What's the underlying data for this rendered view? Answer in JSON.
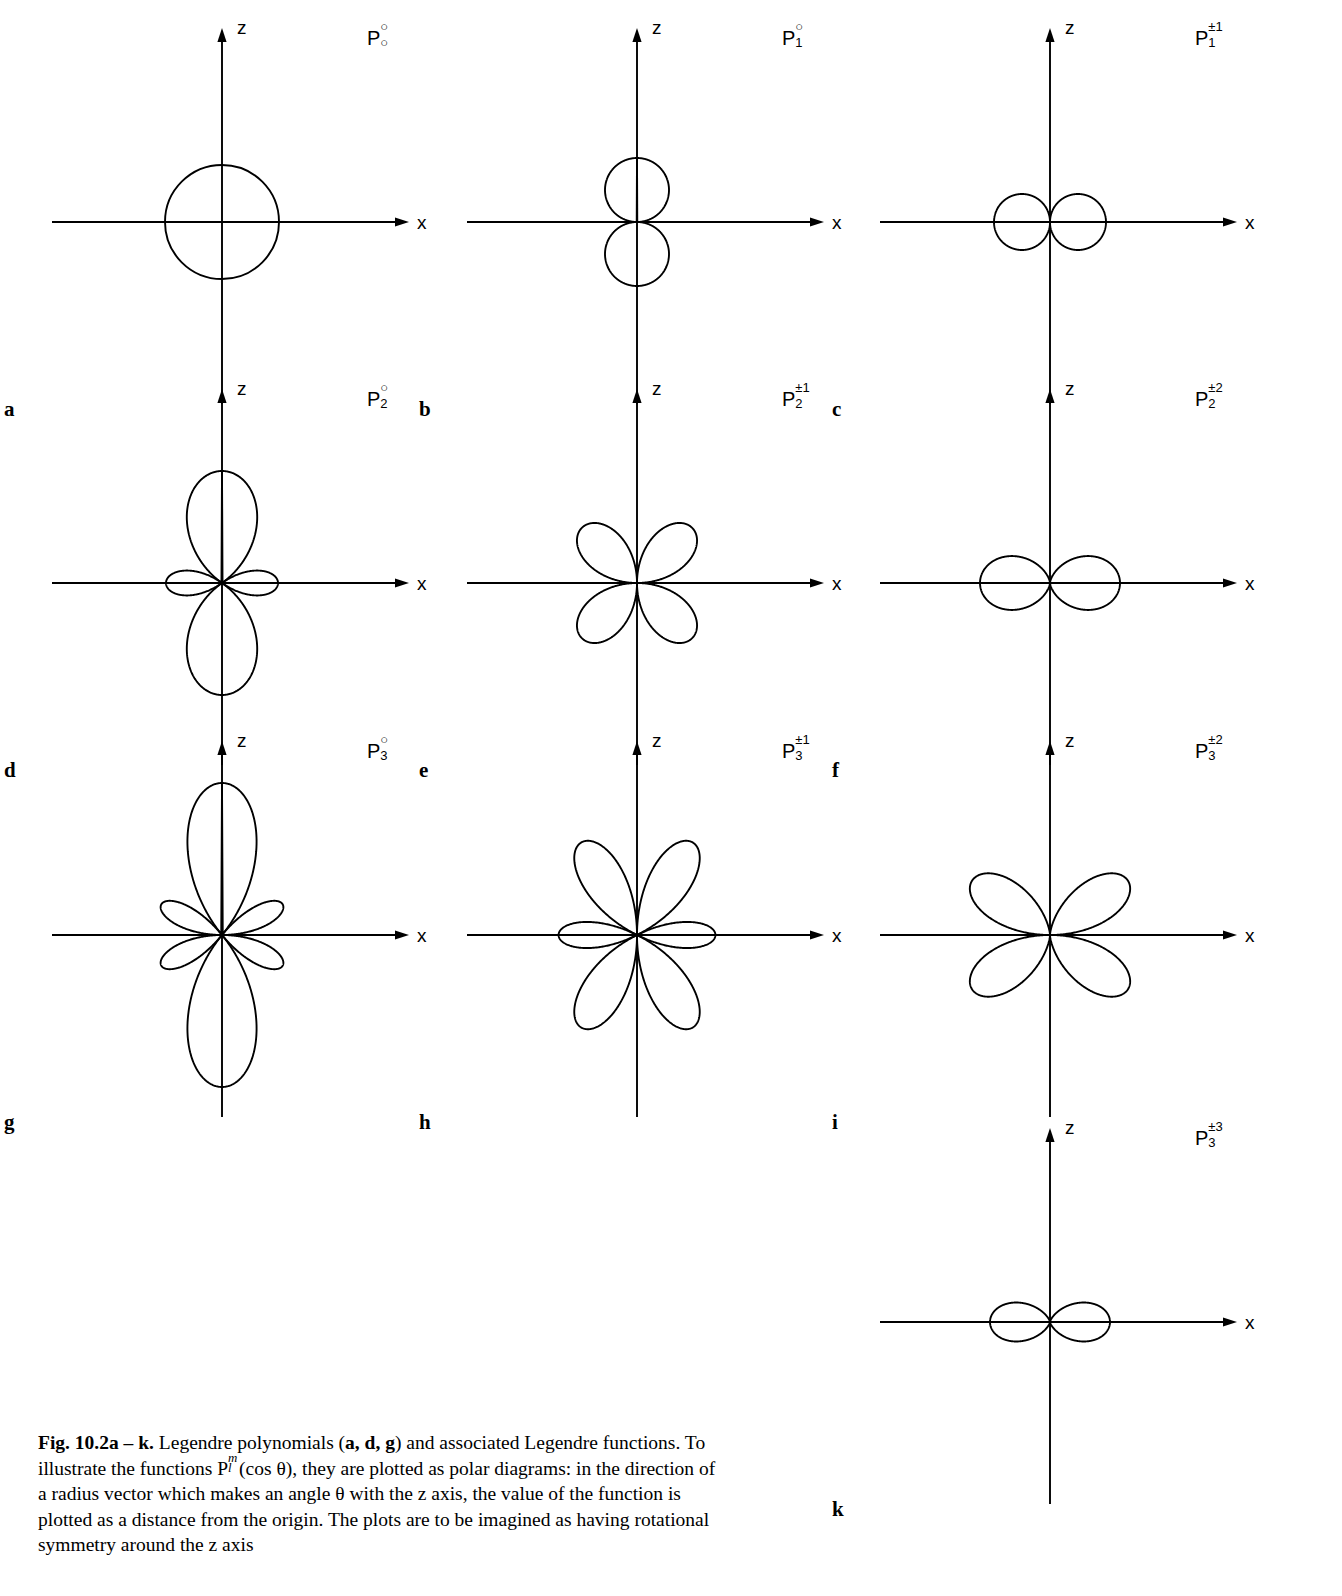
{
  "figure": {
    "axis_labels": {
      "z": "z",
      "x": "x"
    },
    "caption": {
      "lead": "Fig. 10.2a – k.",
      "text_1": " Legendre polynomials (",
      "bold_adg": "a, d, g",
      "text_2": ") and associated Legendre functions. To illustrate the functions P",
      "sup_m": "m",
      "sub_l": "l",
      "text_3": "(cos θ), they are plotted as polar diagrams: in the direction of a radius vector which makes an angle θ with the z axis, the value of the function is plotted as a distance from the origin. The plots are to be imagined as having rotational symmetry around the z axis"
    }
  },
  "chart_data": {
    "type": "line",
    "xlabel": "x",
    "ylabel": "z",
    "grid": false,
    "legend": "none",
    "panels": [
      {
        "letter": "a",
        "label_base": "P",
        "label_sup": "○",
        "label_sub": "○",
        "l": 0,
        "m": 0,
        "formula": "P_0^0 = 1",
        "lobes": 1,
        "lobe_description": "single circle centred on the origin, symmetric about both axes",
        "scale": 1.0
      },
      {
        "letter": "b",
        "label_base": "P",
        "label_sup": "○",
        "label_sub": "1",
        "l": 1,
        "m": 0,
        "formula": "P_1^0 = cosθ",
        "lobes": 2,
        "lobe_description": "two lobes along the z axis (up and down)",
        "scale": 1.0
      },
      {
        "letter": "c",
        "label_base": "P",
        "label_sup": "±1",
        "label_sub": "1",
        "l": 1,
        "m": 1,
        "formula": "P_1^1 = sinθ",
        "lobes": 2,
        "lobe_description": "two lobes along the x axis (left and right)",
        "scale": 1.0
      },
      {
        "letter": "d",
        "label_base": "P",
        "label_sup": "○",
        "label_sub": "2",
        "l": 2,
        "m": 0,
        "formula": "P_2^0 = (3cos²θ − 1)/2",
        "lobes": 4,
        "lobe_description": "two large lobes along z plus a small torus lobe pair along x",
        "scale": 1.0
      },
      {
        "letter": "e",
        "label_base": "P",
        "label_sup": "±1",
        "label_sub": "2",
        "l": 2,
        "m": 1,
        "formula": "P_2^1 = 3 sinθ cosθ",
        "lobes": 4,
        "lobe_description": "four lobes at 45° to the axes",
        "scale": 1.0
      },
      {
        "letter": "f",
        "label_base": "P",
        "label_sup": "±2",
        "label_sub": "2",
        "l": 2,
        "m": 2,
        "formula": "P_2^2 = 3 sin²θ",
        "lobes": 2,
        "lobe_description": "two broad lobes along the x axis",
        "scale": 1.0
      },
      {
        "letter": "g",
        "label_base": "P",
        "label_sup": "○",
        "label_sub": "3",
        "l": 3,
        "m": 0,
        "formula": "P_3^0 = (5cos³θ − 3cosθ)/2",
        "lobes": 6,
        "lobe_description": "two large lobes along z and four small lobes near the x axis",
        "scale": 1.0
      },
      {
        "letter": "h",
        "label_base": "P",
        "label_sup": "±1",
        "label_sub": "3",
        "l": 3,
        "m": 1,
        "formula": "P_3^1 = (3/2) sinθ (5cos²θ − 1)",
        "lobes": 6,
        "lobe_description": "six lobes, four larger tilted lobes plus two along x",
        "scale": 1.0
      },
      {
        "letter": "i",
        "label_base": "P",
        "label_sup": "±2",
        "label_sub": "3",
        "l": 3,
        "m": 2,
        "formula": "P_3^2 = 15 sin²θ cosθ",
        "lobes": 4,
        "lobe_description": "four lobes at about 55° from the z axis",
        "scale": 1.0
      },
      {
        "letter": "k",
        "label_base": "P",
        "label_sup": "±3",
        "label_sub": "3",
        "l": 3,
        "m": 3,
        "formula": "P_3^3 = 15 sin³θ",
        "lobes": 2,
        "lobe_description": "two lobes along the x axis, slightly pinched",
        "scale": 1.0
      }
    ]
  },
  "layout": {
    "panel_positions": [
      {
        "letter": "a",
        "cx": 222,
        "cy": 222,
        "col": 0,
        "row": 0
      },
      {
        "letter": "b",
        "cx": 637,
        "cy": 222,
        "col": 1,
        "row": 0
      },
      {
        "letter": "c",
        "cx": 1050,
        "cy": 222,
        "col": 2,
        "row": 0
      },
      {
        "letter": "d",
        "cx": 222,
        "cy": 583,
        "col": 0,
        "row": 1
      },
      {
        "letter": "e",
        "cx": 637,
        "cy": 583,
        "col": 1,
        "row": 1
      },
      {
        "letter": "f",
        "cx": 1050,
        "cy": 583,
        "col": 2,
        "row": 1
      },
      {
        "letter": "g",
        "cx": 222,
        "cy": 935,
        "col": 0,
        "row": 2
      },
      {
        "letter": "h",
        "cx": 637,
        "cy": 935,
        "col": 1,
        "row": 2
      },
      {
        "letter": "i",
        "cx": 1050,
        "cy": 935,
        "col": 2,
        "row": 2
      },
      {
        "letter": "k",
        "cx": 1050,
        "cy": 1322,
        "col": 2,
        "row": 3
      }
    ]
  }
}
